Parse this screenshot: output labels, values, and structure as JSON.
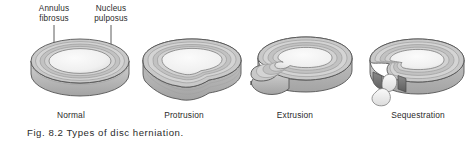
{
  "figure": {
    "caption": "Fig. 8.2  Types of disc herniation.",
    "callouts": {
      "annulus": "Annulus\nfibrosus",
      "nucleus": "Nucleus\npulposus"
    },
    "stages": [
      {
        "id": "normal",
        "label": "Normal"
      },
      {
        "id": "protrusion",
        "label": "Protrusion"
      },
      {
        "id": "extrusion",
        "label": "Extrusion"
      },
      {
        "id": "sequestration",
        "label": "Sequestration"
      }
    ],
    "colors": {
      "background": "#ffffff",
      "text": "#2b2b2b",
      "nucleus_fill": "#f2f2f2",
      "nucleus_shade": "#e2e2e2",
      "annulus_top": "#c9c9c9",
      "annulus_mid": "#b4b4b4",
      "annulus_dark": "#8f8f8f",
      "annulus_light": "#dedede",
      "wall_fill": "#bdbdbd",
      "outline": "#555555",
      "rupture_dark": "#6e6e6e",
      "fragment_fill": "#ededed",
      "leader_line": "#4a4a4a"
    }
  }
}
